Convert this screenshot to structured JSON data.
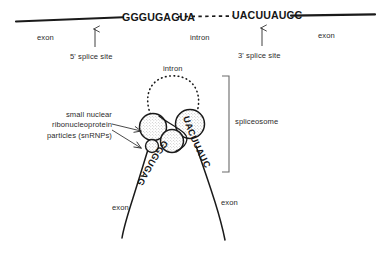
{
  "figure": {
    "ink_color": "#1a1a1a",
    "text_color": "#2b2b2b",
    "background": "#ffffff"
  },
  "top_diagram": {
    "left_exon_label": "exon",
    "right_exon_label": "exon",
    "intron_label": "intron",
    "five_prime_sequence": "GGGUGAGUA",
    "three_prime_sequence": "UACUUAUCC",
    "five_prime_site_label": "5' splice site",
    "three_prime_site_label": "3' splice site"
  },
  "bottom_diagram": {
    "intron_label": "intron",
    "spliceosome_label": "spliceosome",
    "snrnp_label_lines": [
      "small nuclear",
      "ribonucleoprotein",
      "particles (snRNPs)"
    ],
    "snrnp_label_full": "small nuclear ribonucleoprotein particles (snRNPs)",
    "left_exon_label": "exon",
    "right_exon_label": "exon",
    "bound_sequence_left": "GGGUGAGUA",
    "bound_sequence_right": "UACUUAUCC",
    "snrnp_count": 4
  }
}
